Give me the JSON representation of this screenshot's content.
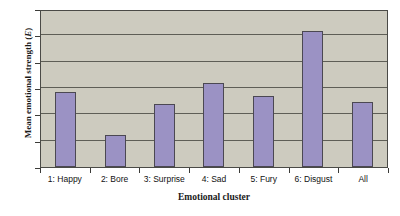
{
  "chart_data": {
    "type": "bar",
    "title": "",
    "xlabel": "Emotional cluster",
    "ylabel": "Mean emotional strength (E)",
    "ylabel_plain": "Mean emotional strength (",
    "ylabel_italic": "E",
    "ylabel_tail": ")",
    "categories": [
      "1: Happy",
      "2: Bore",
      "3: Surprise",
      "4: Sad",
      "5: Fury",
      "6: Disgust",
      "All"
    ],
    "values": [
      28.5,
      12,
      24,
      32,
      27,
      51.5,
      24.5
    ],
    "ylim": [
      0,
      60
    ],
    "yticks": [
      0,
      10,
      20,
      30,
      40,
      50,
      60
    ],
    "ytick_labels": [
      "0",
      "10",
      "20",
      "30",
      "40",
      "50",
      "60"
    ],
    "grid": "horizontal",
    "legend": "none",
    "bar_color": "#9b92c4",
    "bar_edge_color": "#4b4852",
    "plot_background": "#cdcbbf",
    "gridline_color": "#5e5e56",
    "axis_color": "#3b3b38",
    "figure_background": "#ffffff"
  }
}
